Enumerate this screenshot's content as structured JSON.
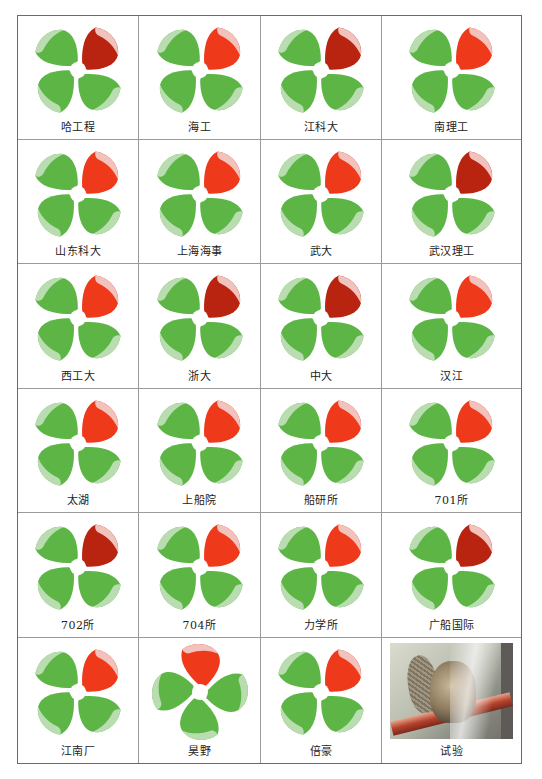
{
  "figure": {
    "colors": {
      "blade_green": "#5cb545",
      "blade_green_light": "#b9ddb0",
      "key_blade_red": "#ee3a1a",
      "key_blade_tip": "#f2c2bc",
      "hub": "#ffffff",
      "grid_line": "#9a9a9a"
    },
    "cells": [
      {
        "label": "哈工程",
        "type": "propeller",
        "red_shade": "dark"
      },
      {
        "label": "海工",
        "type": "propeller",
        "red_shade": "bright"
      },
      {
        "label": "江科大",
        "type": "propeller",
        "red_shade": "dark"
      },
      {
        "label": "南理工",
        "type": "propeller",
        "red_shade": "bright"
      },
      {
        "label": "山东科大",
        "type": "propeller",
        "red_shade": "bright"
      },
      {
        "label": "上海海事",
        "type": "propeller",
        "red_shade": "bright"
      },
      {
        "label": "武大",
        "type": "propeller",
        "red_shade": "bright"
      },
      {
        "label": "武汉理工",
        "type": "propeller",
        "red_shade": "dark"
      },
      {
        "label": "西工大",
        "type": "propeller",
        "red_shade": "bright"
      },
      {
        "label": "浙大",
        "type": "propeller",
        "red_shade": "dark"
      },
      {
        "label": "中大",
        "type": "propeller",
        "red_shade": "dark"
      },
      {
        "label": "汉江",
        "type": "propeller",
        "red_shade": "bright"
      },
      {
        "label": "太湖",
        "type": "propeller",
        "red_shade": "bright"
      },
      {
        "label": "上船院",
        "type": "propeller",
        "red_shade": "bright"
      },
      {
        "label": "船研所",
        "type": "propeller",
        "red_shade": "bright"
      },
      {
        "label": "701所",
        "type": "propeller",
        "red_shade": "bright"
      },
      {
        "label": "702所",
        "type": "propeller",
        "red_shade": "dark"
      },
      {
        "label": "704所",
        "type": "propeller",
        "red_shade": "bright"
      },
      {
        "label": "力学所",
        "type": "propeller",
        "red_shade": "bright"
      },
      {
        "label": "广船国际",
        "type": "propeller",
        "red_shade": "dark"
      },
      {
        "label": "江南厂",
        "type": "propeller",
        "red_shade": "bright"
      },
      {
        "label": "昊野",
        "type": "propeller",
        "red_shade": "bright",
        "rotated": true
      },
      {
        "label": "倍豪",
        "type": "propeller",
        "red_shade": "bright"
      },
      {
        "label": "试验",
        "type": "photo"
      }
    ]
  }
}
